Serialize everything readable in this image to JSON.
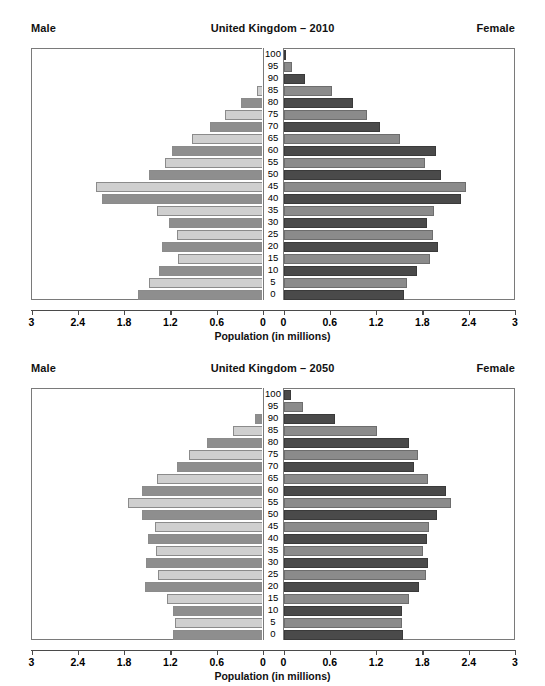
{
  "figure": {
    "axis_title": "Population (in millions)",
    "male_label": "Male",
    "female_label": "Female",
    "colors": {
      "male_light": "#cfcfcf",
      "male_dark": "#8e8e8e",
      "female_light": "#8b8b8b",
      "female_dark": "#4a4a4a",
      "frame": "#7a7a7a",
      "axis": "#4a4a4a",
      "background": "#ffffff"
    }
  },
  "panels": [
    {
      "title": "United Kingdom – 2010"
    },
    {
      "title": "United Kingdom – 2050"
    }
  ],
  "axis": {
    "left_ticks": [
      "3",
      "2.4",
      "1.8",
      "1.2",
      "0.6",
      "0"
    ],
    "right_ticks": [
      "0",
      "0.6",
      "1.2",
      "1.8",
      "2.4",
      "3"
    ],
    "age_labels": [
      "100",
      "95",
      "90",
      "85",
      "80",
      "75",
      "70",
      "65",
      "60",
      "55",
      "50",
      "45",
      "40",
      "35",
      "30",
      "25",
      "20",
      "15",
      "10",
      "5",
      "0"
    ],
    "xmin": 0,
    "xmax": 3
  },
  "chart_data": [
    {
      "type": "bar",
      "title": "United Kingdom – 2010",
      "subtitle": "",
      "xlabel": "Population (in millions)",
      "ylabel": "Age",
      "xlim": [
        0,
        3
      ],
      "grid": false,
      "legend": [
        "Male",
        "Female"
      ],
      "legend_position": "top-left and top-right",
      "orientation": "horizontal-diverging",
      "categories": [
        "100",
        "95",
        "90",
        "85",
        "80",
        "75",
        "70",
        "65",
        "60",
        "55",
        "50",
        "45",
        "40",
        "35",
        "30",
        "25",
        "20",
        "15",
        "10",
        "5",
        "0"
      ],
      "series": [
        {
          "name": "Male",
          "side": "left",
          "values": [
            0.02,
            0.07,
            0.17,
            0.33,
            0.53,
            0.74,
            0.93,
            1.17,
            1.43,
            1.51,
            1.73,
            2.41,
            2.33,
            1.62,
            1.47,
            1.36,
            1.56,
            1.35,
            1.6,
            1.72,
            1.86
          ]
        },
        {
          "name": "Female",
          "side": "right",
          "values": [
            0.02,
            0.1,
            0.27,
            0.62,
            0.9,
            1.08,
            1.25,
            1.5,
            1.97,
            1.83,
            2.04,
            2.36,
            2.29,
            1.94,
            1.85,
            1.93,
            1.99,
            1.89,
            1.73,
            1.6,
            1.55
          ]
        }
      ]
    },
    {
      "type": "bar",
      "title": "United Kingdom – 2050",
      "subtitle": "",
      "xlabel": "Population (in millions)",
      "ylabel": "Age",
      "xlim": [
        0,
        3
      ],
      "grid": false,
      "legend": [
        "Male",
        "Female"
      ],
      "legend_position": "top-left and top-right",
      "orientation": "horizontal-diverging",
      "categories": [
        "100",
        "95",
        "90",
        "85",
        "80",
        "75",
        "70",
        "65",
        "60",
        "55",
        "50",
        "45",
        "40",
        "35",
        "30",
        "25",
        "20",
        "15",
        "10",
        "5",
        "0"
      ],
      "series": [
        {
          "name": "Male",
          "side": "left",
          "values": [
            0.05,
            0.16,
            0.35,
            0.63,
            0.97,
            1.2,
            1.36,
            1.62,
            1.82,
            1.99,
            1.82,
            1.64,
            1.74,
            1.63,
            1.76,
            1.61,
            1.77,
            1.49,
            1.41,
            1.39,
            1.41
          ]
        },
        {
          "name": "Female",
          "side": "right",
          "values": [
            0.09,
            0.25,
            0.66,
            1.2,
            1.62,
            1.74,
            1.69,
            1.86,
            2.1,
            2.16,
            1.98,
            1.88,
            1.85,
            1.8,
            1.87,
            1.84,
            1.75,
            1.62,
            1.53,
            1.53,
            1.54
          ]
        }
      ]
    }
  ]
}
